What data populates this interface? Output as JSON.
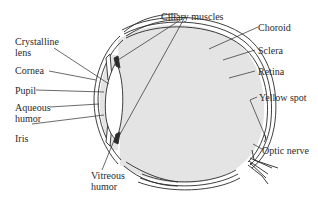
{
  "diagram": {
    "colors": {
      "line": "#2a2a2a",
      "fill": "#e4e4e4",
      "background": "#ffffff"
    },
    "labels": {
      "crystalline_lens_1": "Crystalline",
      "crystalline_lens_2": "lens",
      "cornea": "Cornea",
      "pupil": "Pupil",
      "aqueous_humor_1": "Aqueous",
      "aqueous_humor_2": "humor",
      "iris": "Iris",
      "ciliary_muscles": "Ciliary muscles",
      "choroid": "Choroid",
      "sclera": "Sclera",
      "retina": "Retina",
      "yellow_spot": "Yellow spot",
      "optic_nerve": "Optic nerve",
      "vitreous_humor_1": "Vitreous",
      "vitreous_humor_2": "humor"
    }
  }
}
